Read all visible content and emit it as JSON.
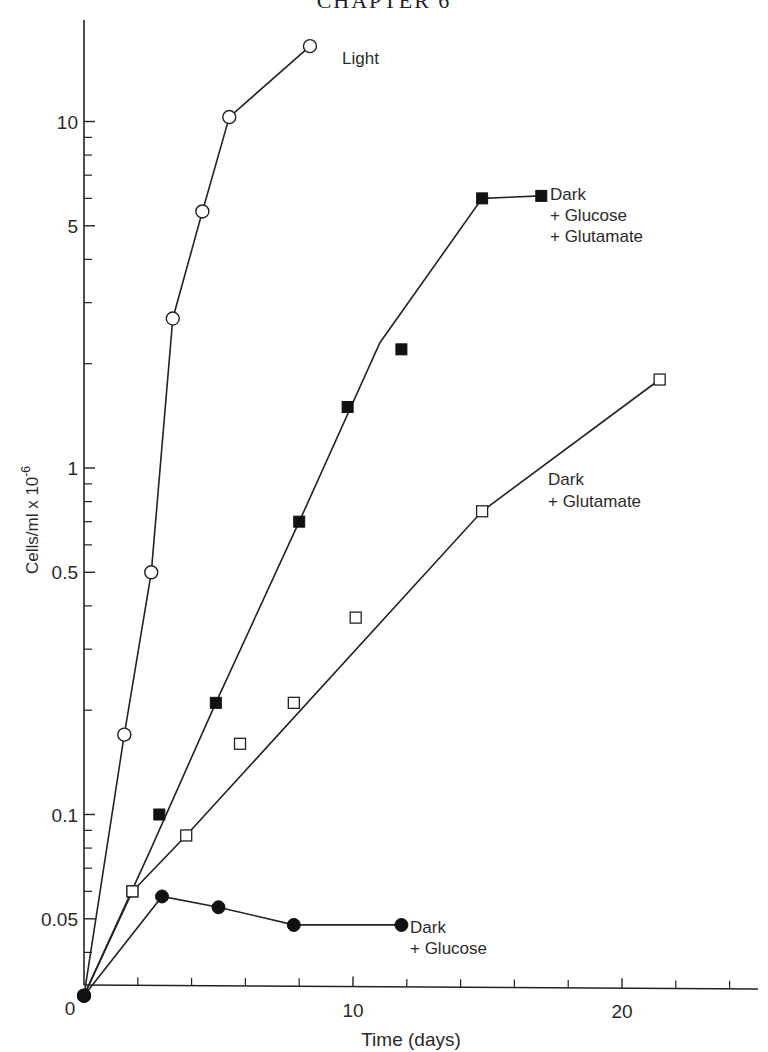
{
  "page": {
    "running_head": "CHAPTER 6"
  },
  "chart_data": {
    "type": "line",
    "title": "",
    "xlabel": "Time (days)",
    "ylabel": "Cells/ml x 10",
    "ylabel_exponent": "-6",
    "xscale": "linear",
    "yscale": "log",
    "xlim": [
      0,
      25
    ],
    "ylim": [
      0.03,
      20
    ],
    "grid": false,
    "legend_position": "inline labels at series ends",
    "x_ticks": {
      "major": [
        0,
        10,
        20
      ],
      "major_labels": [
        "0",
        "10",
        "20"
      ],
      "minor": [
        2,
        4,
        6,
        8,
        12,
        14,
        16,
        18,
        22,
        24
      ]
    },
    "y_ticks": {
      "labeled": [
        10,
        5,
        1,
        0.5,
        0.1,
        0.05
      ],
      "labels": [
        "10",
        "5",
        "1",
        "0.5",
        "0.1",
        "0.05"
      ],
      "minor": [
        9,
        8,
        7,
        6,
        4,
        3,
        2,
        0.9,
        0.8,
        0.7,
        0.6,
        0.4,
        0.3,
        0.2,
        0.09,
        0.08,
        0.07,
        0.06,
        0.04
      ]
    },
    "series": [
      {
        "name": "Light",
        "label_lines": [
          "Light"
        ],
        "marker": "open-circle",
        "points": [
          [
            0,
            0.03
          ],
          [
            1.5,
            0.17
          ],
          [
            2.5,
            0.5
          ],
          [
            3.3,
            2.7
          ],
          [
            4.4,
            5.5
          ],
          [
            5.4,
            10.3
          ],
          [
            8.4,
            16.5
          ]
        ],
        "line": [
          [
            0,
            0.03
          ],
          [
            1.5,
            0.17
          ],
          [
            2.5,
            0.5
          ],
          [
            3.3,
            2.7
          ],
          [
            4.4,
            5.5
          ],
          [
            5.4,
            10.3
          ],
          [
            8.4,
            16.5
          ]
        ]
      },
      {
        "name": "Dark + Glucose + Glutamate",
        "label_lines": [
          "Dark",
          "+ Glucose",
          "+ Glutamate"
        ],
        "marker": "filled-square",
        "points": [
          [
            1.8,
            0.06
          ],
          [
            2.8,
            0.1
          ],
          [
            4.9,
            0.21
          ],
          [
            8.0,
            0.7
          ],
          [
            9.8,
            1.5
          ],
          [
            11.8,
            2.2
          ],
          [
            14.8,
            6.0
          ],
          [
            17.0,
            6.1
          ]
        ],
        "line": [
          [
            0,
            0.03
          ],
          [
            2.5,
            0.08
          ],
          [
            4.9,
            0.21
          ],
          [
            8.0,
            0.7
          ],
          [
            11.0,
            2.3
          ],
          [
            14.8,
            6.0
          ],
          [
            17.0,
            6.1
          ]
        ]
      },
      {
        "name": "Dark + Glutamate",
        "label_lines": [
          "Dark",
          "+ Glutamate"
        ],
        "marker": "open-square",
        "points": [
          [
            1.8,
            0.06
          ],
          [
            3.8,
            0.087
          ],
          [
            5.8,
            0.16
          ],
          [
            7.8,
            0.21
          ],
          [
            10.1,
            0.37
          ],
          [
            14.8,
            0.75
          ],
          [
            21.4,
            1.8
          ]
        ],
        "line": [
          [
            0,
            0.03
          ],
          [
            1.8,
            0.06
          ],
          [
            3.8,
            0.087
          ],
          [
            14.8,
            0.75
          ],
          [
            21.4,
            1.8
          ]
        ]
      },
      {
        "name": "Dark + Glucose",
        "label_lines": [
          "Dark",
          "+ Glucose"
        ],
        "marker": "filled-circle",
        "points": [
          [
            0,
            0.03
          ],
          [
            2.9,
            0.058
          ],
          [
            5.0,
            0.054
          ],
          [
            7.8,
            0.048
          ],
          [
            11.8,
            0.048
          ]
        ],
        "line": [
          [
            0,
            0.03
          ],
          [
            2.9,
            0.058
          ],
          [
            5.0,
            0.054
          ],
          [
            7.8,
            0.048
          ],
          [
            11.8,
            0.048
          ]
        ]
      }
    ]
  }
}
